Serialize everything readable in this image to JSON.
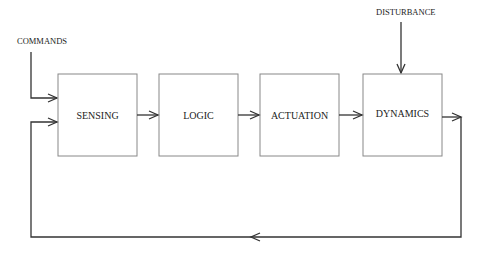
{
  "diagram": {
    "type": "block-diagram",
    "inputs": {
      "commands_label": "COMMANDS",
      "disturbance_label": "DISTURBANCE"
    },
    "blocks": [
      {
        "id": "sensing",
        "label": "SENSING"
      },
      {
        "id": "logic",
        "label": "LOGIC"
      },
      {
        "id": "actuation",
        "label": "ACTUATION"
      },
      {
        "id": "dynamics",
        "label": "DYNAMICS"
      }
    ],
    "edges": [
      {
        "from": "commands",
        "to": "sensing"
      },
      {
        "from": "sensing",
        "to": "logic"
      },
      {
        "from": "logic",
        "to": "actuation"
      },
      {
        "from": "actuation",
        "to": "dynamics"
      },
      {
        "from": "disturbance",
        "to": "dynamics"
      },
      {
        "from": "dynamics",
        "to": "sensing",
        "kind": "feedback"
      }
    ]
  }
}
